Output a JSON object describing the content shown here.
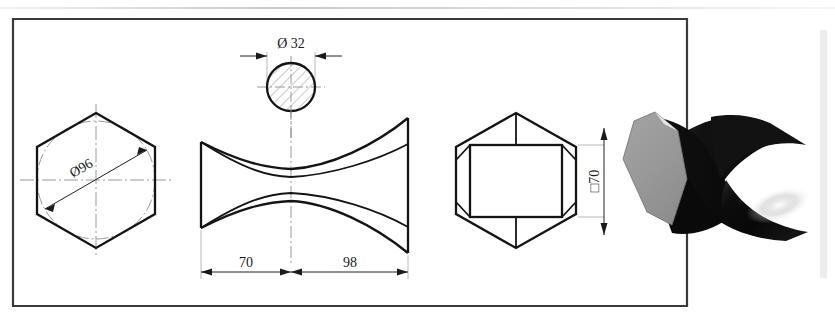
{
  "document": {
    "title": "Hyperboloid hexagonal prism – engineering drawing",
    "frame": {
      "label": "drawing-border"
    }
  },
  "views": {
    "front_hex": {
      "name": "hexagon-front-view",
      "dimension": {
        "label": "Ø96",
        "value": 96,
        "symbol": "Ø",
        "rotation_deg": -30
      }
    },
    "waist_circle": {
      "name": "waist-section-view",
      "dimension": {
        "label": "Ø 32",
        "value": 32,
        "symbol": "Ø"
      }
    },
    "side_hyperboloid": {
      "name": "hyperboloid-side-view",
      "dimensions": [
        {
          "label": "70",
          "value": 70
        },
        {
          "label": "98",
          "value": 98
        }
      ]
    },
    "top_hex": {
      "name": "hexagon-top-view",
      "dimension": {
        "label": "□70",
        "value": 70,
        "symbol": "□",
        "rotation_deg": -90
      }
    },
    "render_3d": {
      "name": "solid-model-render",
      "colors": {
        "face": "#9a9a9a",
        "body_dark": "#0d0d0d",
        "highlight": "#e8e8e8"
      }
    }
  },
  "styles": {
    "line_color": "#1a1a1a",
    "centerline_color": "#8a8a8a",
    "dimension_color": "#2b2b2b",
    "thin_line_color": "#b5b5b5",
    "background": "#ffffff",
    "sidebar_color": "#ededed"
  }
}
